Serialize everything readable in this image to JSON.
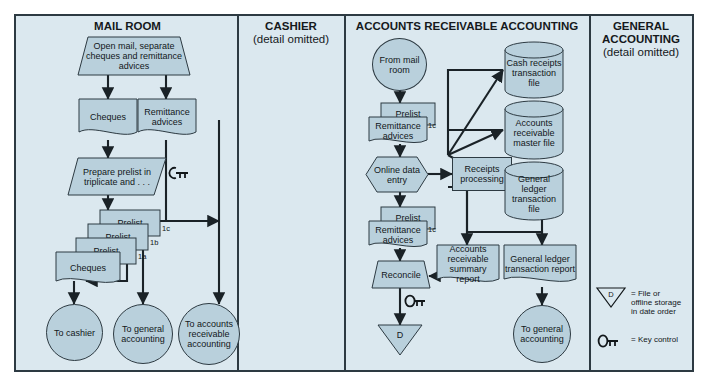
{
  "diagram": {
    "colors": {
      "panel_bg": "#dbe8ef",
      "shape_fill": "#b9d0dc",
      "outline": "#2d3a42",
      "text": "#12171a"
    },
    "columns": [
      {
        "id": "mail-room",
        "title": "MAIL ROOM",
        "subtitle": ""
      },
      {
        "id": "cashier",
        "title": "CASHIER",
        "subtitle": "(detail omitted)"
      },
      {
        "id": "accounts-receivable",
        "title": "ACCOUNTS RECEIVABLE ACCOUNTING",
        "subtitle": ""
      },
      {
        "id": "general-accounting",
        "title": "GENERAL ACCOUNTING",
        "subtitle": "(detail omitted)"
      }
    ]
  },
  "mail_room": {
    "open_mail": "Open mail, separate cheques and remittance advices",
    "cheques": "Cheques",
    "remittance_advices": "Remittance advices",
    "prepare_prelist": "Prepare prelist in triplicate and . . .",
    "prelist_1c": "Prelist",
    "prelist_1b": "Prelist",
    "prelist_1a": "Prelist",
    "tag_1c": "1c",
    "tag_1b": "1b",
    "tag_1a": "1a",
    "cheques_2": "Cheques",
    "to_cashier": "To cashier",
    "to_general_accounting": "To general accounting",
    "to_accounts_receivable": "To accounts receivable accounting"
  },
  "accounts_receivable": {
    "from_mail_room": "From mail room",
    "prelist_top": "Prelist",
    "remittance_advices_top": "Remittance advices",
    "tag_top": "1c",
    "online_data_entry": "Online data entry",
    "receipts_processing": "Receipts processing",
    "cash_receipts_file": "Cash receipts transaction file",
    "ar_master_file": "Accounts receivable master file",
    "gl_transaction_file": "General ledger transaction file",
    "prelist_bottom": "Prelist",
    "remittance_advices_bottom": "Remittance advices",
    "tag_bottom": "1c",
    "reconcile": "Reconcile",
    "ar_summary_report": "Accounts receivable summary report",
    "gl_transaction_report": "General ledger transaction report",
    "file_d": "D",
    "to_general_accounting": "To general accounting"
  },
  "legend": {
    "file_symbol": "D",
    "file_text": "= File or offline storage in date order",
    "key_control_text": "= Key control"
  }
}
